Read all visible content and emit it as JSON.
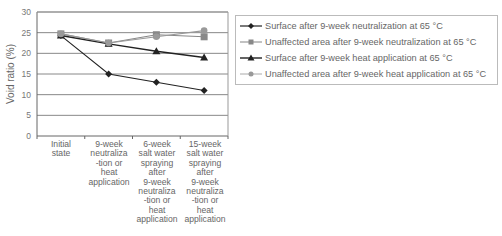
{
  "chart_data": {
    "type": "line",
    "title": "",
    "xlabel": "",
    "ylabel": "Void ratio (%)",
    "ylim": [
      0,
      30
    ],
    "yticks": [
      0,
      5,
      10,
      15,
      20,
      25,
      30
    ],
    "grid": true,
    "legend_position": "right",
    "categories": [
      "Initial state",
      "9-week neutraliza -tion or heat application",
      "6-week salt water spraying after 9-week neutraliza -tion or heat application",
      "15-week salt water spraying after 9-week neutraliza -tion or heat application"
    ],
    "series": [
      {
        "name": "Surface after 9-week neutralization at 65 °C",
        "marker": "diamond",
        "color": "#222222",
        "values": [
          24.3,
          15.0,
          13.0,
          11.0
        ]
      },
      {
        "name": "Unaffected area after 9-week neutralization at 65 °C",
        "marker": "square",
        "color": "#888888",
        "values": [
          24.7,
          22.5,
          24.5,
          24.0
        ]
      },
      {
        "name": "Surface after 9-week heat application at 65 °C",
        "marker": "triangle",
        "color": "#222222",
        "values": [
          24.3,
          22.3,
          20.5,
          19.0
        ]
      },
      {
        "name": "Unaffected area after 9-week heat application at 65 °C",
        "marker": "circle",
        "color": "#999999",
        "values": [
          24.7,
          22.5,
          24.0,
          25.5
        ]
      }
    ]
  },
  "axis": {
    "ylabel": "Void ratio (%)",
    "ytick_labels": [
      "0",
      "5",
      "10",
      "15",
      "20",
      "25",
      "30"
    ]
  },
  "categories_display": [
    "Initial\nstate",
    "9-week\nneutraliza\n-tion or\nheat\napplication",
    "6-week\nsalt water\nspraying\nafter\n9-week\nneutraliza\n-tion or\nheat\napplication",
    "15-week\nsalt water\nspraying\nafter\n9-week\nneutraliza\n-tion or\nheat\napplication"
  ],
  "legend": [
    "Surface after 9-week neutralization at 65 °C",
    "Unaffected area after 9-week neutralization at 65 °C",
    "Surface after 9-week heat application at 65 °C",
    "Unaffected area after 9-week heat application at 65 °C"
  ]
}
